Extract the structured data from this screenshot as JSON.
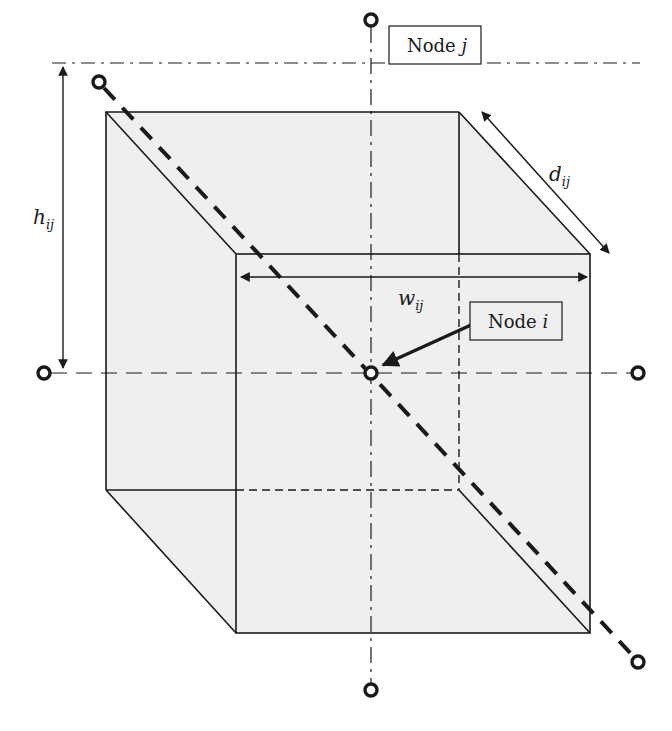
{
  "diagram": {
    "type": "3d-cube-node-neighborhood",
    "colors": {
      "cube_fill": "#efefef",
      "stroke": "#1a1a1a",
      "background": "#ffffff"
    },
    "cube": {
      "back_face": {
        "x1": 106,
        "y1": 112,
        "x2": 459,
        "y2": 490
      },
      "front_face": {
        "x1": 236,
        "y1": 254,
        "x2": 590,
        "y2": 633
      }
    },
    "nodes": {
      "center": {
        "label": "Node",
        "var": "i",
        "x": 371,
        "y": 373
      },
      "top": {
        "label": "Node",
        "var": "j",
        "x": 371,
        "y": 20
      },
      "bottom": {
        "x": 371,
        "y": 690
      },
      "left": {
        "x": 44,
        "y": 373
      },
      "right": {
        "x": 638,
        "y": 373
      },
      "diag_top_left": {
        "x": 99,
        "y": 82
      },
      "diag_bottom_right": {
        "x": 638,
        "y": 662
      }
    },
    "dimensions": {
      "height": {
        "symbol": "h",
        "subscript": "ij"
      },
      "width": {
        "symbol": "w",
        "subscript": "ij"
      },
      "depth": {
        "symbol": "d",
        "subscript": "ij"
      }
    }
  }
}
